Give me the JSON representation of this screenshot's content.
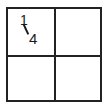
{
  "diagram": {
    "type": "fraction-grid",
    "rows": 2,
    "columns": 2,
    "cells": [
      {
        "position": "top-left",
        "label": "1/4",
        "numerator": "1",
        "denominator": "4"
      },
      {
        "position": "top-right",
        "label": ""
      },
      {
        "position": "bottom-left",
        "label": ""
      },
      {
        "position": "bottom-right",
        "label": ""
      }
    ],
    "line_color": "#222222",
    "background": "#ffffff"
  }
}
